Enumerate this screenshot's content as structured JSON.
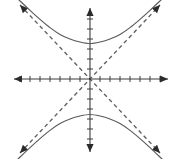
{
  "figure": {
    "background_color": "#ffffff",
    "width": 180,
    "height": 159
  },
  "chart_data": {
    "type": "line",
    "title": "",
    "xlabel": "",
    "ylabel": "",
    "grid": false,
    "legend": false,
    "origin_px": {
      "x": 90,
      "y": 79
    },
    "unit_px": 10,
    "xlim": [
      -7.6,
      7.8
    ],
    "ylim": [
      -7.1,
      7.1
    ],
    "axes": {
      "x_axis": {
        "name": "x-axis",
        "orientation": "horizontal",
        "arrowheads": "both",
        "start_px": {
          "x": 14,
          "y": 79
        },
        "end_px": {
          "x": 168,
          "y": 79
        },
        "tick_values": [
          -7,
          -6,
          -5,
          -4,
          -3,
          -2,
          -1,
          1,
          2,
          3,
          4,
          5,
          6,
          7
        ],
        "tick_labels_visible": false,
        "tick_half_length_px": 3
      },
      "y_axis": {
        "name": "y-axis",
        "orientation": "vertical",
        "arrowheads": "both",
        "start_px": {
          "x": 90,
          "y": 8
        },
        "end_px": {
          "x": 90,
          "y": 152
        },
        "tick_values": [
          -6,
          -5,
          -4,
          -3,
          -2,
          -1,
          1,
          2,
          3,
          4,
          5,
          6
        ],
        "tick_labels_visible": false,
        "tick_half_length_px": 3
      }
    },
    "series": [
      {
        "name": "upper-branch",
        "style": "solid",
        "color": "#5a5a5a",
        "description": "Upper branch of hyperbola opening upward",
        "vertex": {
          "x": 0,
          "y": 3.55
        },
        "points": [
          {
            "x": -7.2,
            "y": 8.0
          },
          {
            "x": -6.0,
            "y": 6.86
          },
          {
            "x": -5.0,
            "y": 5.96
          },
          {
            "x": -4.0,
            "y": 5.14
          },
          {
            "x": -3.0,
            "y": 4.46
          },
          {
            "x": -2.0,
            "y": 4.0
          },
          {
            "x": -1.0,
            "y": 3.7
          },
          {
            "x": 0.0,
            "y": 3.55
          },
          {
            "x": 1.0,
            "y": 3.7
          },
          {
            "x": 2.0,
            "y": 4.0
          },
          {
            "x": 3.0,
            "y": 4.46
          },
          {
            "x": 4.0,
            "y": 5.14
          },
          {
            "x": 5.0,
            "y": 5.96
          },
          {
            "x": 6.0,
            "y": 6.86
          },
          {
            "x": 7.2,
            "y": 8.0
          }
        ]
      },
      {
        "name": "lower-branch",
        "style": "solid",
        "color": "#5a5a5a",
        "description": "Lower branch of hyperbola opening downward",
        "vertex": {
          "x": 0,
          "y": -3.55
        },
        "points": [
          {
            "x": -7.2,
            "y": -8.0
          },
          {
            "x": -6.0,
            "y": -6.86
          },
          {
            "x": -5.0,
            "y": -5.96
          },
          {
            "x": -4.0,
            "y": -5.14
          },
          {
            "x": -3.0,
            "y": -4.46
          },
          {
            "x": -2.0,
            "y": -4.0
          },
          {
            "x": -1.0,
            "y": -3.7
          },
          {
            "x": 0.0,
            "y": -3.55
          },
          {
            "x": 1.0,
            "y": -3.7
          },
          {
            "x": 2.0,
            "y": -4.0
          },
          {
            "x": 3.0,
            "y": -4.46
          },
          {
            "x": 4.0,
            "y": -5.14
          },
          {
            "x": 5.0,
            "y": -5.96
          },
          {
            "x": 6.0,
            "y": -6.86
          },
          {
            "x": 7.2,
            "y": -8.0
          }
        ]
      },
      {
        "name": "asymptote-positive-slope",
        "style": "dashed",
        "color": "#5f5f5f",
        "description": "Dashed asymptote through origin with positive slope",
        "slope": 1.06,
        "from": {
          "x": -7.0,
          "y": -7.4
        },
        "to": {
          "x": 7.0,
          "y": 7.4
        }
      },
      {
        "name": "asymptote-negative-slope",
        "style": "dashed",
        "color": "#5f5f5f",
        "description": "Dashed asymptote through origin with negative slope",
        "slope": -1.06,
        "from": {
          "x": -7.0,
          "y": 7.4
        },
        "to": {
          "x": 7.0,
          "y": -7.4
        }
      }
    ],
    "annotations": []
  }
}
